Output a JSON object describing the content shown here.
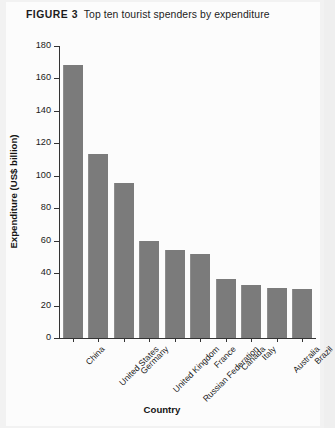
{
  "figure": {
    "number_label": "FIGURE 3",
    "caption": "Top ten tourist spenders by expenditure"
  },
  "source_note": "",
  "chart_data": {
    "type": "bar",
    "title": "Top ten tourist spenders by expenditure",
    "xlabel": "Country",
    "ylabel": "Expenditure (US$ billion)",
    "ylim": [
      0,
      180
    ],
    "ytick_step": 20,
    "yticks": [
      0,
      20,
      40,
      60,
      80,
      100,
      120,
      140,
      160,
      180
    ],
    "ytick_labels": [
      "0",
      "20",
      "40",
      "60",
      "80",
      "100",
      "120",
      "140",
      "160",
      "180"
    ],
    "grid": false,
    "legend": null,
    "bar_color": "#7b7b7b",
    "categories": [
      "China",
      "United States",
      "Germany",
      "United Kingdom",
      "Russian Federation",
      "France",
      "Canada",
      "Italy",
      "Australia",
      "Brazil"
    ],
    "values": [
      168,
      113.5,
      95.5,
      59.5,
      54,
      52,
      36.5,
      32.5,
      31,
      30.5
    ]
  }
}
